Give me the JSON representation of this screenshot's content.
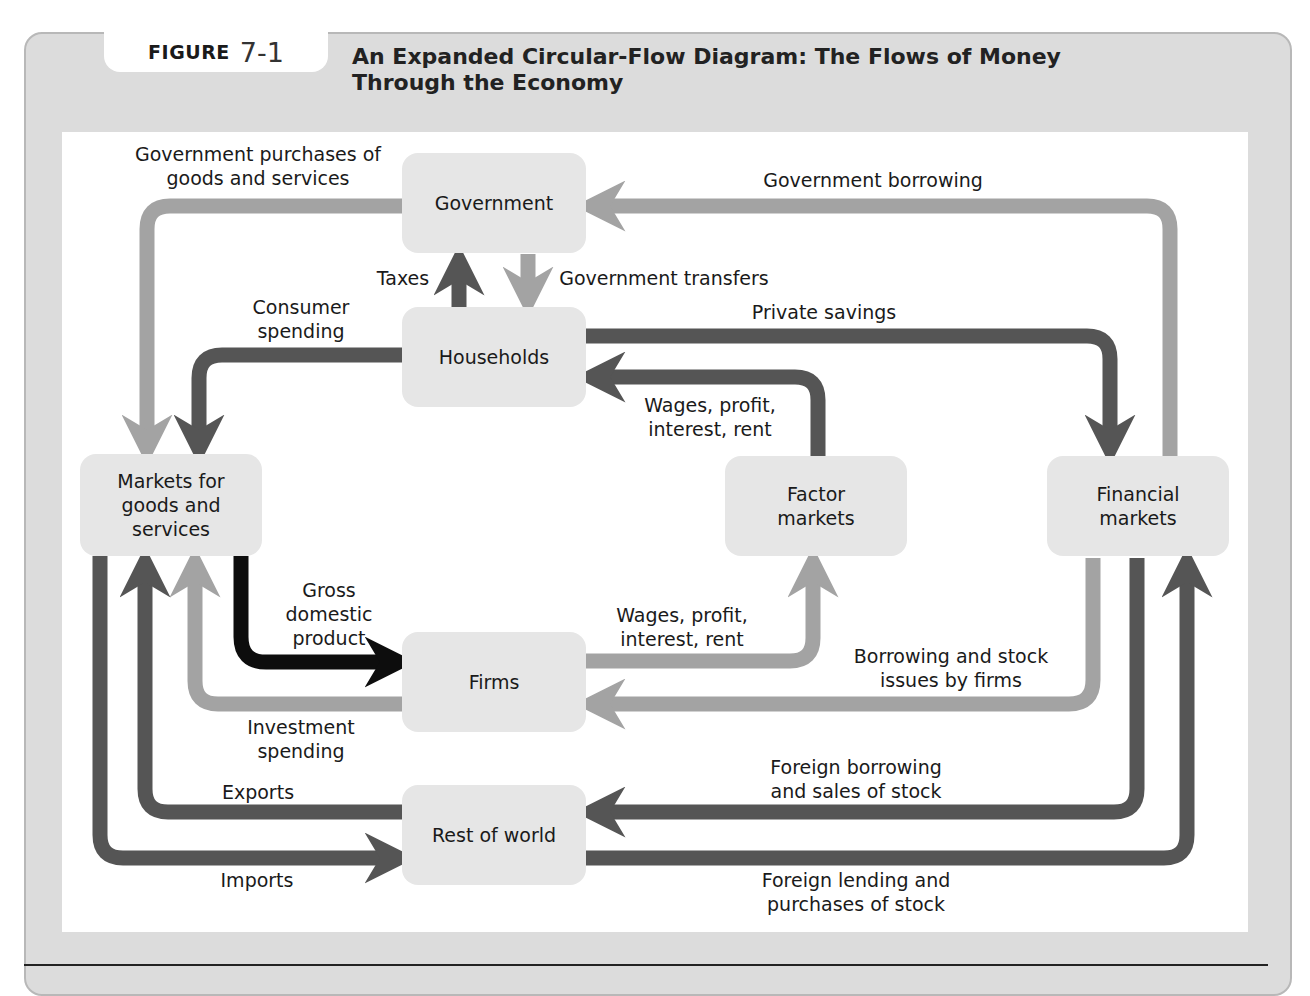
{
  "figure": {
    "label_word": "FIGURE",
    "label_number": "7-1",
    "title_line1": "An Expanded Circular-Flow Diagram: The Flows of Money",
    "title_line2": "Through the Economy"
  },
  "nodes": {
    "government": "Government",
    "households": "Households",
    "markets_goods": "Markets for goods and services",
    "factor_markets": "Factor markets",
    "financial_markets": "Financial markets",
    "firms": "Firms",
    "rest_of_world": "Rest of world"
  },
  "flows": {
    "gov_purchases_1": "Government purchases of",
    "gov_purchases_2": "goods and services",
    "gov_borrowing": "Government borrowing",
    "taxes": "Taxes",
    "gov_transfers": "Government transfers",
    "consumer_spending_1": "Consumer",
    "consumer_spending_2": "spending",
    "private_savings": "Private savings",
    "wages_hh_1": "Wages, profit,",
    "wages_hh_2": "interest, rent",
    "gdp_1": "Gross",
    "gdp_2": "domestic",
    "gdp_3": "product",
    "wages_firms_1": "Wages, profit,",
    "wages_firms_2": "interest, rent",
    "borrowing_firms_1": "Borrowing and stock",
    "borrowing_firms_2": "issues by firms",
    "investment_1": "Investment",
    "investment_2": "spending",
    "exports": "Exports",
    "imports": "Imports",
    "foreign_borrowing_1": "Foreign borrowing",
    "foreign_borrowing_2": "and sales of stock",
    "foreign_lending_1": "Foreign lending and",
    "foreign_lending_2": "purchases of stock"
  },
  "colors": {
    "light_flow": "#a3a3a3",
    "dark_flow": "#555555",
    "gdp_flow": "#0d0d0d",
    "node_fill": "#e6e6e6",
    "frame_fill": "#dcdcdc"
  }
}
